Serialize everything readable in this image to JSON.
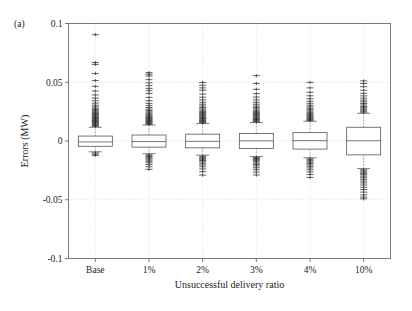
{
  "figure": {
    "panel_label": "(a)",
    "width": 412,
    "height": 311
  },
  "chart_data": {
    "type": "box",
    "title": "",
    "xlabel": "Unsuccessful delivery ratio",
    "ylabel": "Errors (MW)",
    "categories": [
      "Base",
      "1%",
      "2%",
      "3%",
      "4%",
      "10%"
    ],
    "ytick_labels": [
      "0.1",
      "0.05",
      "0",
      "-0.05",
      "-0.1"
    ],
    "ytick_values": [
      0.1,
      0.05,
      0,
      -0.05,
      -0.1
    ],
    "ylim": [
      -0.1,
      0.1
    ],
    "grid": "horizontal-and-vertical-dotted",
    "legend": "none",
    "units": "MW",
    "boxes": [
      {
        "category": "Base",
        "q1": -0.0045,
        "median": -0.0008,
        "q3": 0.0042,
        "whisker_low": -0.0092,
        "whisker_high": 0.0117,
        "outliers_high": [
          0.0125,
          0.0132,
          0.0139,
          0.0146,
          0.0152,
          0.0158,
          0.0163,
          0.0169,
          0.0175,
          0.0181,
          0.0187,
          0.0193,
          0.0199,
          0.0205,
          0.0212,
          0.0219,
          0.0226,
          0.0233,
          0.0241,
          0.0249,
          0.0258,
          0.0268,
          0.0279,
          0.0291,
          0.0305,
          0.0322,
          0.0342,
          0.0365,
          0.0392,
          0.0425,
          0.0465,
          0.0514,
          0.0575,
          0.0652,
          0.0668,
          0.0905
        ],
        "outliers_low": [
          -0.0102,
          -0.0112,
          -0.0123
        ]
      },
      {
        "category": "1%",
        "q1": -0.0052,
        "median": -0.0005,
        "q3": 0.0051,
        "whisker_low": -0.0108,
        "whisker_high": 0.0136,
        "outliers_high": [
          0.0142,
          0.0149,
          0.0155,
          0.0161,
          0.0167,
          0.0173,
          0.0179,
          0.0185,
          0.0192,
          0.0199,
          0.0206,
          0.0213,
          0.0221,
          0.0229,
          0.0238,
          0.0248,
          0.0259,
          0.0271,
          0.0285,
          0.0301,
          0.032,
          0.0343,
          0.0371,
          0.0405,
          0.0428,
          0.0448,
          0.0471,
          0.0495,
          0.0522,
          0.0553,
          0.0568,
          0.0582
        ],
        "outliers_low": [
          -0.0118,
          -0.0126,
          -0.0134,
          -0.0143,
          -0.0152,
          -0.0162,
          -0.0173,
          -0.0186,
          -0.0201,
          -0.0219,
          -0.0241
        ]
      },
      {
        "category": "2%",
        "q1": -0.0058,
        "median": -0.0003,
        "q3": 0.0058,
        "whisker_low": -0.0121,
        "whisker_high": 0.0148,
        "outliers_high": [
          0.0155,
          0.0161,
          0.0167,
          0.0173,
          0.0179,
          0.0186,
          0.0192,
          0.0198,
          0.0205,
          0.0212,
          0.0219,
          0.0227,
          0.0235,
          0.0243,
          0.0252,
          0.0262,
          0.0273,
          0.0285,
          0.0298,
          0.0313,
          0.033,
          0.035,
          0.0373,
          0.04,
          0.0432,
          0.0452,
          0.0475,
          0.0498
        ],
        "outliers_low": [
          -0.013,
          -0.0138,
          -0.0147,
          -0.0156,
          -0.0166,
          -0.0177,
          -0.0189,
          -0.0203,
          -0.0219,
          -0.0238,
          -0.0261,
          -0.029
        ]
      },
      {
        "category": "3%",
        "q1": -0.0063,
        "median": 0.0001,
        "q3": 0.0064,
        "whisker_low": -0.0132,
        "whisker_high": 0.0157,
        "outliers_high": [
          0.0164,
          0.017,
          0.0177,
          0.0183,
          0.019,
          0.0196,
          0.0203,
          0.021,
          0.0218,
          0.0226,
          0.0234,
          0.0243,
          0.0252,
          0.0262,
          0.0273,
          0.0285,
          0.0298,
          0.0313,
          0.033,
          0.035,
          0.0374,
          0.0403,
          0.044,
          0.0489,
          0.0556
        ],
        "outliers_low": [
          -0.0141,
          -0.0149,
          -0.0158,
          -0.0167,
          -0.0177,
          -0.0188,
          -0.02,
          -0.0213,
          -0.0228,
          -0.0245,
          -0.0265,
          -0.0289
        ]
      },
      {
        "category": "4%",
        "q1": -0.0069,
        "median": 0.0003,
        "q3": 0.0071,
        "whisker_low": -0.0143,
        "whisker_high": 0.0168,
        "outliers_high": [
          0.0175,
          0.0182,
          0.0189,
          0.0196,
          0.0203,
          0.0211,
          0.0219,
          0.0227,
          0.0236,
          0.0245,
          0.0255,
          0.0266,
          0.0278,
          0.0291,
          0.0305,
          0.0321,
          0.0339,
          0.036,
          0.0385,
          0.0415,
          0.0452,
          0.0499
        ],
        "outliers_low": [
          -0.0152,
          -0.0161,
          -0.017,
          -0.018,
          -0.0191,
          -0.0203,
          -0.0216,
          -0.023,
          -0.0246,
          -0.0264,
          -0.0285,
          -0.031
        ]
      },
      {
        "category": "10%",
        "q1": -0.0118,
        "median": 0.0002,
        "q3": 0.0117,
        "whisker_low": -0.0235,
        "whisker_high": 0.0236,
        "outliers_high": [
          0.0245,
          0.0254,
          0.0263,
          0.0273,
          0.0283,
          0.0294,
          0.0306,
          0.0319,
          0.0333,
          0.0348,
          0.0365,
          0.0384,
          0.0406,
          0.0432,
          0.0462,
          0.049,
          0.0512
        ],
        "outliers_low": [
          -0.0245,
          -0.0255,
          -0.0265,
          -0.0276,
          -0.0287,
          -0.0299,
          -0.0312,
          -0.0326,
          -0.0341,
          -0.0357,
          -0.0374,
          -0.0393,
          -0.0413,
          -0.0435,
          -0.0459,
          -0.0478,
          -0.0492
        ]
      }
    ]
  }
}
